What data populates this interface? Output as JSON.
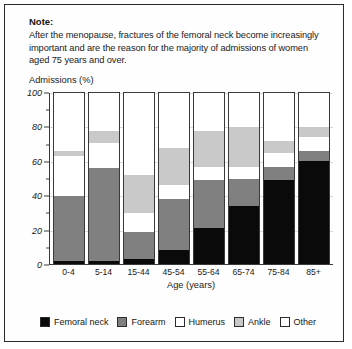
{
  "note": {
    "title": "Note:",
    "body": "After the menopause, fractures of the femoral neck become increasingly important and are the reason for the majority of admissions of women aged 75 years and over."
  },
  "chart_data": {
    "type": "bar",
    "stacked": true,
    "stacked_mode": "percent",
    "title": "",
    "xlabel": "Age (years)",
    "ylabel": "Admissions (%)",
    "ylim": [
      0,
      100
    ],
    "yticks": [
      0,
      20,
      40,
      60,
      80,
      100
    ],
    "yticks_minor": [
      10,
      30,
      50,
      70,
      90
    ],
    "grid": true,
    "legend_position": "bottom",
    "categories": [
      "0-4",
      "5-14",
      "15-44",
      "45-54",
      "55-64",
      "65-74",
      "75-84",
      "85+"
    ],
    "series": [
      {
        "name": "Femoral neck",
        "color": "#0a0a0a",
        "values": [
          2,
          2,
          3,
          8,
          21,
          34,
          49,
          60
        ]
      },
      {
        "name": "Forearm",
        "color": "#808080",
        "values": [
          38,
          54,
          16,
          30,
          28,
          16,
          8,
          6
        ]
      },
      {
        "name": "Humerus",
        "color": "#ffffff",
        "values": [
          23,
          15,
          11,
          8,
          8,
          7,
          8,
          8
        ]
      },
      {
        "name": "Ankle",
        "color": "#c9c9c9",
        "values": [
          3,
          7,
          22,
          22,
          21,
          23,
          7,
          6
        ]
      },
      {
        "name": "Other",
        "color": "#ffffff",
        "values": [
          34,
          22,
          48,
          32,
          22,
          20,
          28,
          20
        ]
      }
    ]
  }
}
